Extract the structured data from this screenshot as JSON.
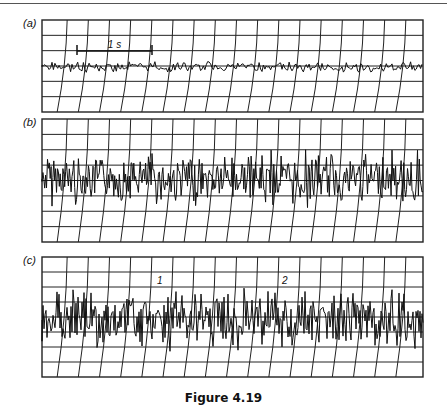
{
  "figure": {
    "caption": "Figure 4.19",
    "panels": [
      {
        "id": "a",
        "label": "(a)",
        "box": [
          42,
          20,
          423,
          112
        ],
        "rows": 6,
        "cols": 18,
        "baseline": 67,
        "amplitude": 6,
        "density": 1.4,
        "seed": 3,
        "scale_bar": {
          "label": "1 s",
          "x1": 77,
          "x2": 152,
          "y": 51
        }
      },
      {
        "id": "b",
        "label": "(b)",
        "box": [
          42,
          119,
          423,
          242
        ],
        "rows": 8,
        "cols": 18,
        "baseline": 179,
        "amplitude": 30,
        "density": 2.2,
        "seed": 7
      },
      {
        "id": "c",
        "label": "(c)",
        "box": [
          42,
          257,
          423,
          377
        ],
        "rows": 8,
        "cols": 18,
        "baseline": 320,
        "amplitude": 34,
        "density": 2.0,
        "seed": 11,
        "annotations": [
          {
            "text": "1",
            "x": 157,
            "y": 284
          },
          {
            "text": "2",
            "x": 282,
            "y": 284
          }
        ]
      }
    ]
  },
  "colors": {
    "ink": "#111111",
    "grid": "#222222",
    "background": "#ffffff"
  }
}
